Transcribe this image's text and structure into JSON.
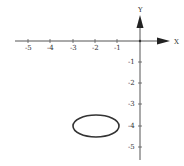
{
  "diagram": {
    "type": "coordinate-plane",
    "x_axis": {
      "label": "X",
      "ticks": [
        "-5",
        "-4",
        "-3",
        "-2",
        "-1"
      ]
    },
    "y_axis": {
      "label": "Y",
      "ticks": [
        "-1",
        "-2",
        "-3",
        "-4",
        "-5"
      ]
    },
    "shapes": [
      {
        "kind": "ellipse",
        "center": [
          -2,
          -4
        ],
        "rx_units": 1,
        "ry_units": 0.5
      }
    ],
    "colors": {
      "axis": "#555555",
      "ellipse": "#333333",
      "background": "#ffffff"
    }
  }
}
